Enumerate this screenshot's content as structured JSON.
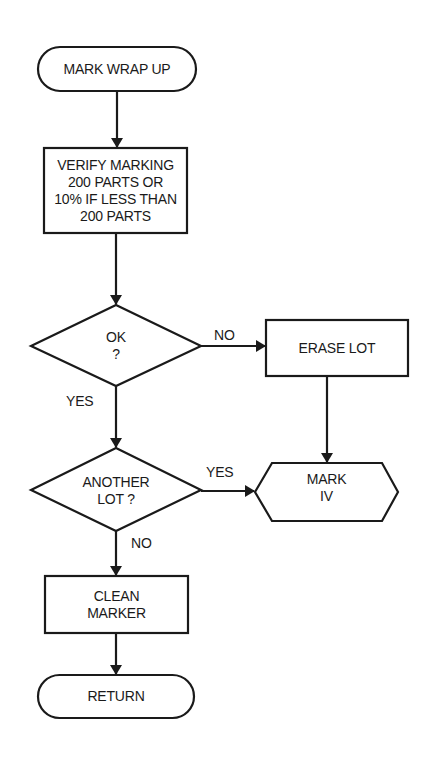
{
  "diagram": {
    "type": "flowchart",
    "nodes": [
      {
        "id": "start",
        "shape": "terminal",
        "lines": [
          "MARK WRAP UP"
        ]
      },
      {
        "id": "verify",
        "shape": "process",
        "lines": [
          "VERIFY MARKING",
          "200 PARTS OR",
          "10% IF LESS THAN",
          "200 PARTS"
        ]
      },
      {
        "id": "ok",
        "shape": "decision",
        "lines": [
          "OK",
          "?"
        ]
      },
      {
        "id": "erase",
        "shape": "process",
        "lines": [
          "ERASE LOT"
        ]
      },
      {
        "id": "another",
        "shape": "decision",
        "lines": [
          "ANOTHER",
          "LOT ?"
        ]
      },
      {
        "id": "mark4",
        "shape": "hexagon",
        "lines": [
          "MARK",
          "IV"
        ]
      },
      {
        "id": "clean",
        "shape": "process",
        "lines": [
          "CLEAN",
          "MARKER"
        ]
      },
      {
        "id": "return",
        "shape": "terminal",
        "lines": [
          "RETURN"
        ]
      }
    ],
    "edges": [
      {
        "from": "start",
        "to": "verify",
        "label": ""
      },
      {
        "from": "verify",
        "to": "ok",
        "label": ""
      },
      {
        "from": "ok",
        "to": "erase",
        "label": "NO"
      },
      {
        "from": "ok",
        "to": "another",
        "label": "YES"
      },
      {
        "from": "erase",
        "to": "mark4",
        "label": ""
      },
      {
        "from": "another",
        "to": "mark4",
        "label": "YES"
      },
      {
        "from": "another",
        "to": "clean",
        "label": "NO"
      },
      {
        "from": "clean",
        "to": "return",
        "label": ""
      }
    ],
    "edge_labels": {
      "ok_no": "NO",
      "ok_yes": "YES",
      "another_yes": "YES",
      "another_no": "NO"
    },
    "colors": {
      "stroke": "#1a1a1a",
      "background": "#ffffff"
    }
  }
}
